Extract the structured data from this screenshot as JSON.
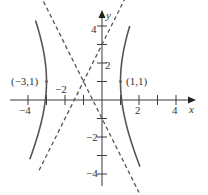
{
  "chart_data": {
    "type": "line",
    "title": "",
    "xlabel": "x",
    "ylabel": "y",
    "xlim": [
      -4.5,
      5
    ],
    "ylim": [
      -4.6,
      4.9
    ],
    "grid": false,
    "x_ticks": [
      -4,
      -3,
      -2,
      -1,
      1,
      2,
      3,
      4
    ],
    "x_tick_labels": [
      {
        "value": -4,
        "label": "−4"
      },
      {
        "value": -2,
        "label": "−2"
      },
      {
        "value": 2,
        "label": "2"
      },
      {
        "value": 4,
        "label": "4"
      }
    ],
    "y_ticks": [
      -4,
      -3,
      -2,
      -1,
      1,
      2,
      3,
      4
    ],
    "y_tick_labels": [
      {
        "value": 4,
        "label": "4"
      },
      {
        "value": 2,
        "label": "2"
      },
      {
        "value": -2,
        "label": "−2"
      },
      {
        "value": -4,
        "label": "−4"
      }
    ],
    "center": [
      -1,
      1
    ],
    "a": 2,
    "b": 4,
    "series": [
      {
        "name": "hyperbola-right-branch",
        "style": "solid",
        "y_range": [
          -3.6,
          4.0
        ]
      },
      {
        "name": "hyperbola-left-branch",
        "style": "solid",
        "y_range": [
          -3.2,
          4.3
        ]
      },
      {
        "name": "asymptote-positive-slope",
        "style": "dashed",
        "equation": "y = 2x + 3",
        "x_range": [
          -3.4,
          1.25
        ]
      },
      {
        "name": "asymptote-negative-slope",
        "style": "dashed",
        "equation": "y = -2x - 1",
        "x_range": [
          -3.5,
          2.0
        ]
      }
    ],
    "annotations": [
      {
        "text": "(−3,1)",
        "point": [
          -3,
          1
        ]
      },
      {
        "text": "(1,1)",
        "point": [
          1,
          1
        ]
      }
    ]
  },
  "labels": {
    "x_axis": "x",
    "y_axis": "y",
    "vertex_left": "(−3,1)",
    "vertex_right": "(1,1)",
    "x_tick_neg4": "−4",
    "x_tick_neg2": "−2",
    "x_tick_2": "2",
    "x_tick_4": "4",
    "y_tick_4": "4",
    "y_tick_2": "2",
    "y_tick_neg2": "−2",
    "y_tick_neg4": "−4"
  },
  "layout": {
    "origin_px": [
      102,
      100
    ],
    "unit_px": 18.5,
    "colors": {
      "axis": "#3a3a3a",
      "curve": "#555555",
      "text": "#333333"
    }
  }
}
